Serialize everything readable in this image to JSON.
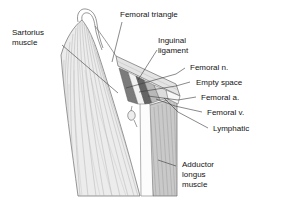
{
  "figure": {
    "type": "anatomical-illustration",
    "background_color": "#ffffff",
    "line_color": "#4a4a4a",
    "text_color": "#141414"
  },
  "labels": {
    "sartorius_muscle": "Sartorius\nmuscle",
    "femoral_triangle": "Femoral triangle",
    "inguinal_ligament": "Inguinal\nligament",
    "femoral_n": "Femoral n.",
    "empty_space": "Empty space",
    "femoral_a": "Femoral a.",
    "femoral_v": "Femoral v.",
    "lymphatic": "Lymphatic",
    "adductor_longus_muscle": "Adductor\nlongus\nmuscle"
  },
  "structures": {
    "sartorius_fill": "#e9e9e9",
    "adductor_fill": "#c9c9c9",
    "femoral_nerve_fill": "#7d7d7d",
    "femoral_artery_fill": "#5f5f5f",
    "femoral_vein_fill": "#b5b5b5",
    "empty_space_fill": "#efefef",
    "inguinal_ligament_fill": "#dedede",
    "lymphatic_fill": "#d5d5d5"
  }
}
